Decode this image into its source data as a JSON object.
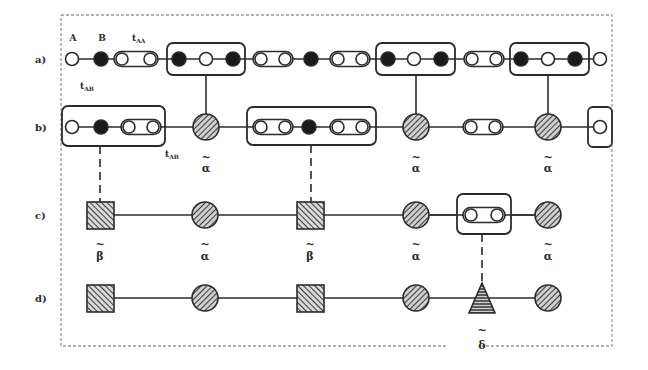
{
  "figure": {
    "rows": [
      {
        "id": "a",
        "label": "a)"
      },
      {
        "id": "b",
        "label": "b)"
      },
      {
        "id": "c",
        "label": "c)"
      },
      {
        "id": "d",
        "label": "d)"
      }
    ],
    "node_labels": {
      "A": "A",
      "B": "B",
      "tAA": "t",
      "tAA_sub": "AA",
      "tAB": "t",
      "tAB_sub": "AB",
      "tAB_b": "t",
      "tAB_b_sub": "AB"
    },
    "greek_labels": {
      "alpha": "α",
      "beta": "β",
      "delta": "δ",
      "tilde": "~"
    },
    "legend": {
      "open_circle": "atom A (open circle)",
      "filled_circle": "atom B (filled circle)",
      "capsule": "A–A dimer bond t_AA",
      "hatched_circle": "renormalized site α̃",
      "hatched_square": "renormalized site β̃",
      "hatched_triangle": "renormalized site δ̃"
    },
    "colors": {
      "stroke": "#2b2b2b",
      "fill_dark": "#1a1a1a",
      "border_dashed": "#9a9a9a",
      "hatch": "#3a3a3a",
      "background": "#ffffff"
    }
  }
}
